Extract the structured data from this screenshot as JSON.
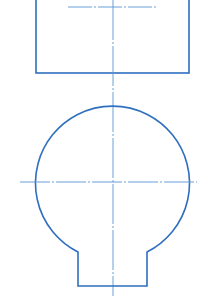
{
  "drawing": {
    "type": "technical-drawing",
    "views": [
      "top-view-rectangle",
      "front-view-circle-with-tab"
    ],
    "colors": {
      "outline": "#2f6fbf",
      "centerline": "#5a95d6",
      "background": "#ffffff"
    },
    "rectangle": {
      "x": 36,
      "y": -5,
      "width": 153,
      "height": 78
    },
    "top_centerline": {
      "x1": 68,
      "x2": 157,
      "y": 7
    },
    "vertical_centerline": {
      "x": 113,
      "y1": 0,
      "y2": 296
    },
    "circle": {
      "cx": 113,
      "cy": 182,
      "r": 77
    },
    "horizontal_centerline": {
      "x1": 20,
      "x2": 197,
      "y": 182
    },
    "tab": {
      "left_x": 78,
      "right_x": 147,
      "shoulder_y": 252,
      "bottom_y": 286
    }
  }
}
